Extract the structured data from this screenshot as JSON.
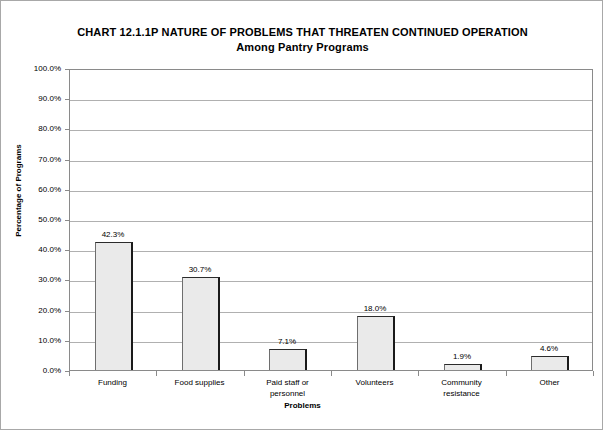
{
  "chart_data": {
    "type": "bar",
    "title": "CHART 12.1.1P   NATURE OF PROBLEMS THAT THREATEN CONTINUED OPERATION",
    "subtitle": "Among Pantry Programs",
    "xlabel": "Problems",
    "ylabel": "Percentage of Programs",
    "categories": [
      "Funding",
      "Food supplies",
      "Paid staff or\npersonnel",
      "Volunteers",
      "Community\nresistance",
      "Other"
    ],
    "category_lines": [
      [
        "Funding"
      ],
      [
        "Food supplies"
      ],
      [
        "Paid staff or",
        "personnel"
      ],
      [
        "Volunteers"
      ],
      [
        "Community",
        "resistance"
      ],
      [
        "Other"
      ]
    ],
    "values": [
      42.3,
      30.7,
      7.1,
      18.0,
      1.9,
      4.6
    ],
    "value_labels": [
      "42.3%",
      "30.7%",
      "7.1%",
      "18.0%",
      "1.9%",
      "4.6%"
    ],
    "ylim": [
      0,
      100
    ],
    "ytick_values": [
      0,
      10,
      20,
      30,
      40,
      50,
      60,
      70,
      80,
      90,
      100
    ],
    "ytick_labels": [
      "0.0%",
      "10.0%",
      "20.0%",
      "30.0%",
      "40.0%",
      "50.0%",
      "60.0%",
      "70.0%",
      "80.0%",
      "90.0%",
      "100.0%"
    ],
    "grid": true,
    "legend": "none",
    "bar_fill_color": "#eaeaea",
    "bar_border_color": "#555555",
    "grid_color": "#b0b0b0",
    "axis_color": "#8a8a8a",
    "text_color": "#000000",
    "background_color": "#ffffff"
  }
}
